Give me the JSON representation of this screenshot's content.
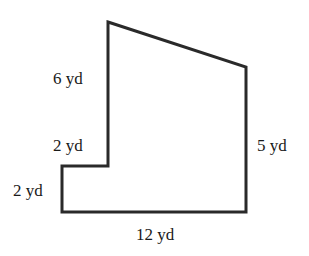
{
  "figure": {
    "type": "composite-polygon",
    "stroke_color": "#2a2a2a",
    "stroke_width": 3,
    "vertices": [
      [
        108,
        22
      ],
      [
        246,
        67
      ],
      [
        246,
        212
      ],
      [
        62,
        212
      ],
      [
        62,
        166
      ],
      [
        108,
        166
      ]
    ],
    "labels": {
      "left_upper_edge": "6 yd",
      "step_top_edge": "2 yd",
      "step_left_edge": "2 yd",
      "bottom_edge": "12 yd",
      "right_edge": "5 yd"
    }
  }
}
